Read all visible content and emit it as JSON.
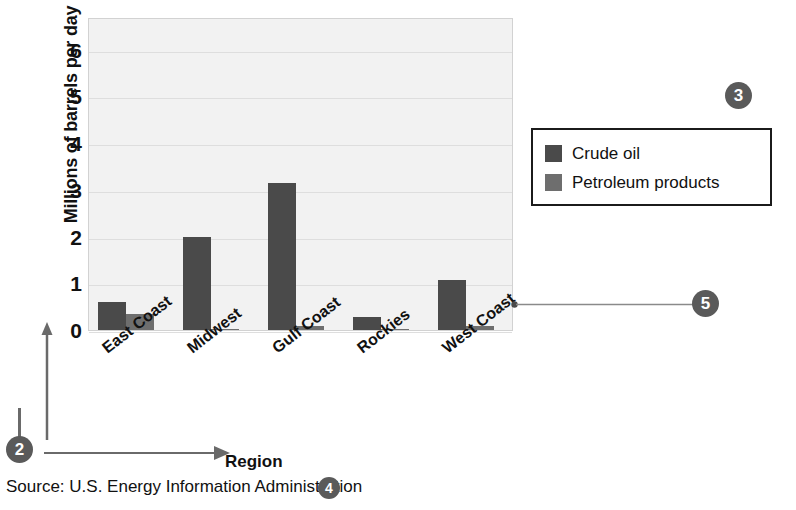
{
  "chart_data": {
    "type": "bar",
    "title": "",
    "xlabel": "Region",
    "ylabel": "Millions of barrels per day",
    "ylim": [
      0,
      6.7
    ],
    "yticks": [
      0,
      1,
      2,
      3,
      4,
      5,
      6
    ],
    "ytick_labels": [
      "0",
      "1",
      "2",
      "3",
      "4",
      "5",
      "6"
    ],
    "grid": true,
    "grid_axis": "y",
    "legend_position": "right",
    "categories": [
      "East Coast",
      "Midwest",
      "Gulf Coast",
      "Rockies",
      "West Coast"
    ],
    "series": [
      {
        "name": "Crude oil",
        "color": "#4a4a4a",
        "values": [
          0.6,
          2.0,
          3.15,
          0.28,
          1.07
        ]
      },
      {
        "name": "Petroleum products",
        "color": "#6e6e6e",
        "values": [
          0.34,
          0.03,
          0.09,
          0.02,
          0.08
        ]
      }
    ],
    "source": "Source: U.S. Energy Information Administration"
  },
  "legend": {
    "entries": [
      {
        "label": "Crude oil",
        "swatch": "crude"
      },
      {
        "label": "Petroleum products",
        "swatch": "petro"
      }
    ]
  },
  "callouts": [
    {
      "id": "callout-3",
      "label": "3"
    },
    {
      "id": "callout-5",
      "label": "5"
    },
    {
      "id": "callout-2",
      "label": "2"
    },
    {
      "id": "callout-4",
      "label": "4"
    }
  ],
  "colors": {
    "crude_oil": "#4a4a4a",
    "petroleum_products": "#6e6e6e",
    "plot_background": "#f2f2f2",
    "gridline": "#dedede",
    "callout_badge": "#5a5a5a",
    "text": "#111111"
  }
}
